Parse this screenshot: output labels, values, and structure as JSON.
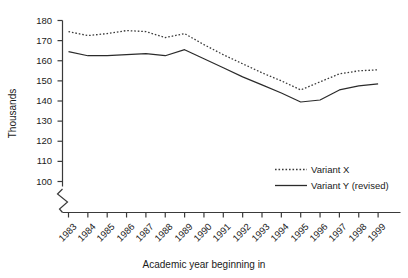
{
  "chart_data": {
    "type": "line",
    "title": "",
    "xlabel": "Academic year beginning in",
    "ylabel": "Thousands",
    "categories": [
      1983,
      1984,
      1985,
      1986,
      1987,
      1988,
      1989,
      1990,
      1991,
      1992,
      1993,
      1994,
      1995,
      1996,
      1997,
      1998,
      1999
    ],
    "xtick_labels": [
      "1983",
      "1984",
      "1985",
      "1986",
      "1987",
      "1988",
      "1989",
      "1990",
      "1991",
      "1992",
      "1993",
      "1994",
      "1995",
      "1996",
      "1997",
      "1998",
      "1999"
    ],
    "ytick_labels": [
      "100",
      "110",
      "120",
      "130",
      "140",
      "150",
      "160",
      "170",
      "180"
    ],
    "ytick_values": [
      100,
      110,
      120,
      130,
      140,
      150,
      160,
      170,
      180
    ],
    "ylim": [
      100,
      180
    ],
    "y_axis_break": true,
    "grid": false,
    "legend_position": "inside-lower-right",
    "series": [
      {
        "name": "Variant X",
        "style": "dotted",
        "color": "#3a3a3a",
        "values": [
          174.5,
          172.5,
          173.5,
          175.0,
          174.5,
          171.5,
          173.5,
          168.0,
          163.0,
          158.5,
          154.0,
          150.0,
          145.5,
          149.5,
          153.5,
          155.0,
          155.5
        ]
      },
      {
        "name": "Variant Y (revised)",
        "style": "solid",
        "color": "#2b2b2b",
        "values": [
          164.5,
          162.5,
          162.5,
          163.0,
          163.5,
          162.5,
          165.5,
          161.0,
          156.5,
          152.0,
          148.0,
          144.0,
          139.5,
          140.5,
          145.5,
          147.5,
          148.5
        ]
      }
    ]
  },
  "legend": {
    "items": [
      {
        "label": "Variant X"
      },
      {
        "label": "Variant Y (revised)"
      }
    ]
  }
}
